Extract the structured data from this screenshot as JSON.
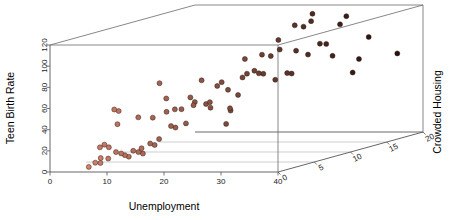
{
  "figure": {
    "kind": "3d-scatter-plot",
    "background": "#ffffff",
    "frame_color": "#6a6a6a",
    "grid_color": "#b9b9b9",
    "point_stroke": "#2a1410"
  },
  "axes": {
    "x": {
      "name": "x-axis",
      "title": "Unemployment",
      "ticks": [
        0,
        10,
        20,
        30,
        40
      ],
      "tick_labels": [
        "0",
        "10",
        "20",
        "30",
        "40"
      ],
      "range": [
        0,
        40
      ]
    },
    "y": {
      "name": "y-axis",
      "title": "Teen Birth Rate",
      "ticks": [
        0,
        20,
        40,
        60,
        80,
        100,
        120
      ],
      "tick_labels": [
        "0",
        "20",
        "40",
        "60",
        "80",
        "100",
        "120"
      ],
      "range": [
        0,
        120
      ]
    },
    "z": {
      "name": "z-axis",
      "title": "Crowded Housing",
      "ticks": [
        0,
        5,
        10,
        15,
        20
      ],
      "tick_labels": [
        "0",
        "5",
        "10",
        "15",
        "20"
      ],
      "range": [
        0,
        20
      ]
    }
  },
  "chart_data": {
    "type": "scatter",
    "title": "",
    "xlabel": "Unemployment",
    "ylabel": "Teen Birth Rate",
    "zlabel": "Crowded Housing",
    "xlim": [
      0,
      40
    ],
    "ylim": [
      0,
      120
    ],
    "zlim": [
      0,
      20
    ],
    "grid": true,
    "legend": "none",
    "color_encoding": "point color darkens with increasing Crowded Housing; salmon = low, dark brown/black = high",
    "color_low": "#e08a72",
    "color_high": "#20100c",
    "n_points": 77,
    "points": [
      {
        "x": 4.9,
        "y": 2,
        "z": 1.5
      },
      {
        "x": 5.4,
        "y": 5,
        "z": 2.0
      },
      {
        "x": 5.8,
        "y": 4,
        "z": 2.4
      },
      {
        "x": 6.1,
        "y": 9,
        "z": 2.2
      },
      {
        "x": 6.4,
        "y": 7,
        "z": 3.0
      },
      {
        "x": 5.2,
        "y": 18,
        "z": 2.8
      },
      {
        "x": 5.6,
        "y": 20,
        "z": 3.1
      },
      {
        "x": 6.0,
        "y": 17,
        "z": 3.4
      },
      {
        "x": 7.0,
        "y": 12,
        "z": 3.6
      },
      {
        "x": 7.4,
        "y": 10,
        "z": 4.0
      },
      {
        "x": 7.8,
        "y": 8,
        "z": 4.2
      },
      {
        "x": 8.1,
        "y": 6,
        "z": 4.5
      },
      {
        "x": 8.5,
        "y": 11,
        "z": 4.8
      },
      {
        "x": 8.9,
        "y": 9,
        "z": 5.2
      },
      {
        "x": 9.3,
        "y": 7,
        "z": 5.5
      },
      {
        "x": 9.7,
        "y": 13,
        "z": 5.0
      },
      {
        "x": 10.2,
        "y": 16,
        "z": 5.8
      },
      {
        "x": 10.6,
        "y": 14,
        "z": 6.1
      },
      {
        "x": 11.0,
        "y": 19,
        "z": 6.4
      },
      {
        "x": 7.2,
        "y": 53,
        "z": 3.2
      },
      {
        "x": 7.6,
        "y": 51,
        "z": 3.5
      },
      {
        "x": 7.0,
        "y": 38,
        "z": 3.8
      },
      {
        "x": 9.0,
        "y": 42,
        "z": 5.1
      },
      {
        "x": 10.4,
        "y": 40,
        "z": 6.0
      },
      {
        "x": 11.2,
        "y": 72,
        "z": 6.3
      },
      {
        "x": 11.8,
        "y": 44,
        "z": 6.8
      },
      {
        "x": 12.2,
        "y": 30,
        "z": 7.1
      },
      {
        "x": 12.6,
        "y": 28,
        "z": 7.4
      },
      {
        "x": 13.0,
        "y": 46,
        "z": 7.0
      },
      {
        "x": 13.4,
        "y": 45,
        "z": 7.6
      },
      {
        "x": 13.8,
        "y": 31,
        "z": 7.9
      },
      {
        "x": 14.2,
        "y": 55,
        "z": 8.2
      },
      {
        "x": 14.6,
        "y": 50,
        "z": 8.5
      },
      {
        "x": 15.0,
        "y": 48,
        "z": 8.0
      },
      {
        "x": 15.4,
        "y": 70,
        "z": 8.8
      },
      {
        "x": 15.8,
        "y": 47,
        "z": 9.1
      },
      {
        "x": 16.2,
        "y": 43,
        "z": 9.4
      },
      {
        "x": 16.6,
        "y": 49,
        "z": 9.0
      },
      {
        "x": 17.0,
        "y": 63,
        "z": 9.7
      },
      {
        "x": 17.4,
        "y": 66,
        "z": 10.0
      },
      {
        "x": 17.8,
        "y": 26,
        "z": 10.3
      },
      {
        "x": 18.2,
        "y": 38,
        "z": 10.6
      },
      {
        "x": 18.6,
        "y": 41,
        "z": 10.2
      },
      {
        "x": 19.0,
        "y": 52,
        "z": 11.0
      },
      {
        "x": 19.4,
        "y": 68,
        "z": 11.3
      },
      {
        "x": 19.8,
        "y": 71,
        "z": 11.6
      },
      {
        "x": 20.2,
        "y": 86,
        "z": 11.0
      },
      {
        "x": 20.6,
        "y": 73,
        "z": 12.0
      },
      {
        "x": 21.0,
        "y": 70,
        "z": 12.3
      },
      {
        "x": 21.4,
        "y": 69,
        "z": 12.6
      },
      {
        "x": 21.8,
        "y": 88,
        "z": 12.1
      },
      {
        "x": 22.2,
        "y": 85,
        "z": 13.0
      },
      {
        "x": 22.6,
        "y": 62,
        "z": 13.3
      },
      {
        "x": 23.0,
        "y": 90,
        "z": 13.6
      },
      {
        "x": 23.4,
        "y": 100,
        "z": 13.1
      },
      {
        "x": 23.8,
        "y": 67,
        "z": 14.0
      },
      {
        "x": 24.2,
        "y": 66,
        "z": 14.3
      },
      {
        "x": 24.6,
        "y": 87,
        "z": 14.6
      },
      {
        "x": 25.0,
        "y": 112,
        "z": 14.1
      },
      {
        "x": 25.4,
        "y": 109,
        "z": 15.0
      },
      {
        "x": 25.8,
        "y": 82,
        "z": 15.3
      },
      {
        "x": 26.2,
        "y": 120,
        "z": 15.6
      },
      {
        "x": 26.6,
        "y": 114,
        "z": 15.1
      },
      {
        "x": 27.0,
        "y": 91,
        "z": 16.0
      },
      {
        "x": 27.6,
        "y": 90,
        "z": 16.4
      },
      {
        "x": 28.2,
        "y": 78,
        "z": 16.8
      },
      {
        "x": 29.0,
        "y": 107,
        "z": 17.2
      },
      {
        "x": 29.6,
        "y": 114,
        "z": 17.6
      },
      {
        "x": 30.2,
        "y": 60,
        "z": 18.0
      },
      {
        "x": 30.8,
        "y": 72,
        "z": 18.4
      },
      {
        "x": 32.0,
        "y": 92,
        "z": 18.8
      },
      {
        "x": 33.5,
        "y": 129,
        "z": 19.2
      },
      {
        "x": 36.0,
        "y": 75,
        "z": 19.6
      },
      {
        "x": 38.0,
        "y": 128,
        "z": 20.0
      },
      {
        "x": 12.0,
        "y": 57,
        "z": 6.6
      },
      {
        "x": 18.0,
        "y": 58,
        "z": 10.4
      }
    ]
  }
}
